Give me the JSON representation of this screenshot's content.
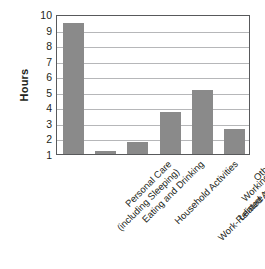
{
  "chart_data": {
    "type": "bar",
    "title": "",
    "xlabel": "",
    "ylabel": "Hours",
    "ylim": [
      1,
      10
    ],
    "yticks": [
      10,
      9,
      8,
      7,
      6,
      5,
      4,
      3,
      2,
      1
    ],
    "grid": true,
    "legend": null,
    "bar_color": "#8a8a8a",
    "categories": [
      "Personal Care (including Sleeping)",
      "Eating and Drinking",
      "Household Activities",
      "Working and Work-Related Activities",
      "Leisure and Sports",
      "Other"
    ],
    "category_lines": [
      [
        "Personal Care",
        "(including Sleeping)"
      ],
      [
        "Eating and Drinking",
        ""
      ],
      [
        "Household Activities",
        ""
      ],
      [
        "Working and",
        "Work-Related Activities"
      ],
      [
        "Leisure and Sports",
        ""
      ],
      [
        "Other",
        ""
      ]
    ],
    "values": [
      9.4,
      1.2,
      1.8,
      3.7,
      5.1,
      2.6
    ]
  },
  "axes": {
    "y_title": "Hours"
  }
}
